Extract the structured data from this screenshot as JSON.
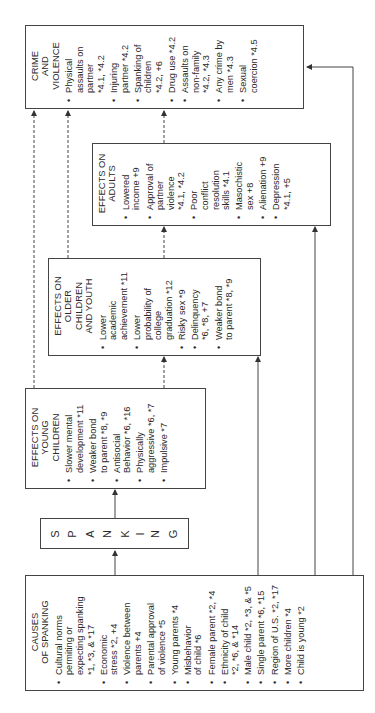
{
  "diagram": {
    "orientation": "rotated-90-ccw",
    "spanking": {
      "letters": [
        "S",
        "P",
        "A",
        "N",
        "K",
        "I",
        "N",
        "G"
      ]
    },
    "causes": {
      "title": "CAUSES\nOF SPANKING",
      "items": [
        "Cultural norms\npermiting or\nexpecting spanking\n*1, *3, & *17",
        "Economic\nstress *2, +4",
        "Violence between\nparents +4",
        "Parental approval\nof violence *5",
        "Young parents *4",
        "Misbehavior\nof child *6",
        "Female parent *2, *4",
        "Ethnicity of child\n*2, *6, & *14",
        "Male child *2, *3, & *5",
        "Single parent *6, *15",
        "Region of U.S. *2, *17",
        "More children *4",
        "Child is young *2"
      ]
    },
    "young_children": {
      "title": "EFFECTS ON\nYOUNG\nCHILDREN",
      "items": [
        "Slower mental\ndevelopment *11",
        "Weaker bond\nto parent *8, *9",
        "Antisocial\nBehavior *6, *16",
        "Physically\naggressive *6, *7",
        "Impulsive *7"
      ]
    },
    "older_children": {
      "title": "EFFECTS ON\nOLDER\nCHILDREN\nAND YOUTH",
      "items": [
        "Lower\nacademic\nachievement *11",
        "Lower\nprobability of\ncollege\ngraduation *12",
        "Risky sex *9",
        "Delinquency\n*6, *8, +7",
        "Weaker bond\nto parent *8, *9"
      ]
    },
    "adults": {
      "title": "EFFECTS ON\nADULTS",
      "items": [
        "Lowered\nincome +9",
        "Approval of\npartner\nviolence\n*4.1, *4.2",
        "Poor\nconflict\nresolution\nskills *4.1",
        "Masochistic\nsex +8",
        "Alienation +9",
        "Depression\n*4.1, +5"
      ]
    },
    "crime": {
      "title": "CRIME\nAND\nVIOLENCE",
      "items": [
        "Physical\nassaults on\npartner\n*4.1, *4.2",
        "Injuring\npartner *4.2",
        "Spanking of\nchildren\n*4.2, +6",
        "Drug use *4.2",
        "Assaults on\nnon-family\n*4.2, *4.3",
        "Any crime by\nmen *4.3",
        "Sexual\ncoercion *4.5"
      ]
    },
    "colors": {
      "line": "#444444",
      "text": "#2a2a2a",
      "background": "#ffffff"
    }
  }
}
